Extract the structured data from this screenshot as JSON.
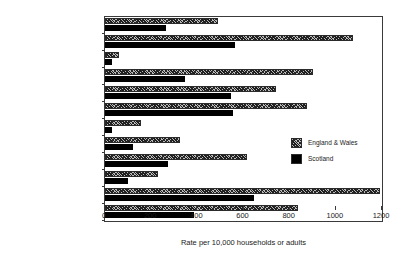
{
  "chart_data": {
    "type": "bar",
    "orientation": "horizontal",
    "title": "",
    "xlabel": "Rate per 10,000 households or adults",
    "ylabel": "",
    "xlim": [
      0,
      1200
    ],
    "xticks": [
      0,
      200,
      400,
      600,
      800,
      1000,
      1200
    ],
    "grid": false,
    "legend_position": "right-middle",
    "categories": [
      "Other personal thefts",
      "Other household thefts",
      "Robbery",
      "Assault",
      "Household vandalism",
      "Vehicle vandalism",
      "Thefts from person",
      "Bicycle thefts",
      "Attempted vehicle thefts",
      "Theft of vehicle",
      "Thefts from vehicles",
      "Housebreaking"
    ],
    "series": [
      {
        "name": "England & Wales",
        "pattern": "hatched",
        "color": "#b9b9b9",
        "values": [
          490,
          1075,
          60,
          900,
          740,
          875,
          155,
          325,
          615,
          230,
          1190,
          835
        ]
      },
      {
        "name": "Scotland",
        "pattern": "solid",
        "color": "#000000",
        "values": [
          265,
          565,
          30,
          345,
          545,
          555,
          30,
          120,
          275,
          100,
          645,
          385
        ]
      }
    ]
  },
  "legend": {
    "items": [
      {
        "label": "England & Wales"
      },
      {
        "label": "Scotland"
      }
    ]
  },
  "axis": {
    "x_title": "Rate per 10,000 households or adults"
  }
}
